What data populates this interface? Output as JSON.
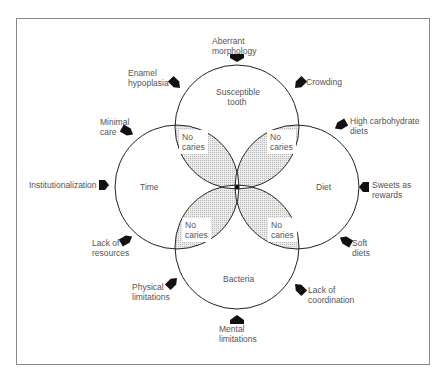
{
  "diagram": {
    "type": "venn",
    "circles": [
      {
        "id": "top",
        "label": "Susceptible tooth"
      },
      {
        "id": "left",
        "label": "Time"
      },
      {
        "id": "right",
        "label": "Diet"
      },
      {
        "id": "bottom",
        "label": "Bacteria"
      }
    ],
    "overlap_label": "No caries",
    "overlaps": [
      {
        "id": "top-left",
        "line1": "No",
        "line2": "caries"
      },
      {
        "id": "top-right",
        "line1": "No",
        "line2": "caries"
      },
      {
        "id": "bottom-left",
        "line1": "No",
        "line2": "caries"
      },
      {
        "id": "bottom-right",
        "line1": "No",
        "line2": "caries"
      }
    ],
    "center_fill": "#000000",
    "overlap_fill": "#dcdcdc",
    "factors": {
      "aberrant_morphology": {
        "line1": "Aberrant",
        "line2": "morphology"
      },
      "enamel_hypoplasia": {
        "line1": "Enamel",
        "line2": "hypoplasia"
      },
      "crowding": {
        "line1": "Crowding"
      },
      "minimal_care": {
        "line1": "Minimal",
        "line2": "care"
      },
      "high_carbohydrate_diets": {
        "line1": "High carbohydrate",
        "line2": "diets"
      },
      "institutionalization": {
        "line1": "Institutionalization"
      },
      "sweets_as_rewards": {
        "line1": "Sweets as",
        "line2": "rewards"
      },
      "lack_of_resources": {
        "line1": "Lack of",
        "line2": "resources"
      },
      "soft_diets": {
        "line1": "Soft",
        "line2": "diets"
      },
      "physical_limitations": {
        "line1": "Physical",
        "line2": "limitations"
      },
      "lack_of_coordination": {
        "line1": "Lack of",
        "line2": "coordination"
      },
      "mental_limitations": {
        "line1": "Mental",
        "line2": "limitations"
      }
    },
    "arrow_icon": "pentagon-arrow"
  }
}
